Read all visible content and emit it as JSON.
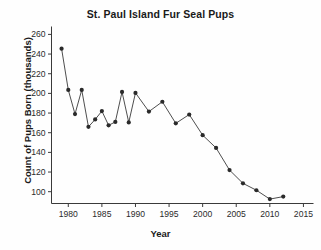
{
  "chart_data": {
    "type": "line",
    "title": "St. Paul Island Fur Seal Pups",
    "xlabel": "Year",
    "ylabel": "Count of Pups Born (thousands)",
    "xlim": [
      1977.5,
      2016.5
    ],
    "ylim": [
      88,
      266
    ],
    "xticks": [
      1980,
      1985,
      1990,
      1995,
      2000,
      2005,
      2010,
      2015
    ],
    "yticks": [
      100,
      120,
      140,
      160,
      180,
      200,
      220,
      240,
      260
    ],
    "grid": false,
    "legend": false,
    "marker": "filled-circle",
    "line_color": "#3a3a3a",
    "marker_color": "#2a2a2a",
    "x": [
      1979,
      1980,
      1981,
      1982,
      1983,
      1984,
      1985,
      1986,
      1987,
      1988,
      1989,
      1990,
      1992,
      1994,
      1996,
      1998,
      2000,
      2002,
      2004,
      2006,
      2008,
      2010,
      2012
    ],
    "values": [
      245.5,
      203.5,
      179.0,
      203.5,
      166.0,
      173.5,
      182.0,
      167.5,
      171.0,
      201.5,
      170.5,
      200.5,
      181.5,
      191.5,
      169.5,
      178.5,
      157.5,
      144.5,
      122.0,
      108.5,
      101.5,
      92.5,
      95.0
    ]
  },
  "axis_labels": {
    "x_tick_labels": [
      "1980",
      "1985",
      "1990",
      "1995",
      "2000",
      "2005",
      "2010",
      "2015"
    ],
    "y_tick_labels": [
      "100",
      "120",
      "140",
      "160",
      "180",
      "200",
      "220",
      "240",
      "260"
    ]
  }
}
